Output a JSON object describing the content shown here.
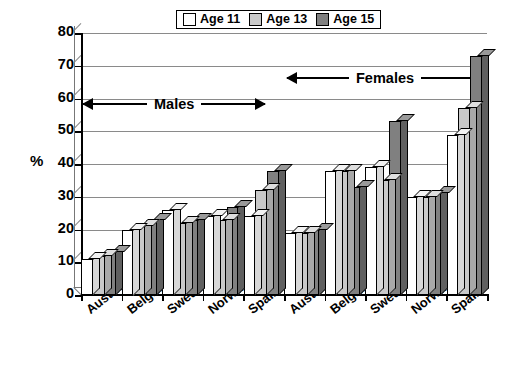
{
  "chart_data": {
    "type": "bar",
    "title": "",
    "subtitle": "",
    "xlabel": "",
    "ylabel": "%",
    "ylim": [
      0,
      80
    ],
    "ytick_step": 10,
    "yticks": [
      80,
      70,
      60,
      50,
      40,
      30,
      20,
      10,
      0
    ],
    "grid": true,
    "legend_position": "top-center",
    "style": "3d-clustered-columns",
    "categories": [
      "Austria",
      "Belgium",
      "Sweden",
      "Norway",
      "Spain",
      "Austria",
      "Belgium",
      "Sweden",
      "Norway",
      "Spain"
    ],
    "series": [
      {
        "name": "Age 11",
        "color": "#ffffff",
        "values": [
          11,
          20,
          26,
          24,
          24,
          19,
          38,
          39,
          30,
          49
        ]
      },
      {
        "name": "Age 13",
        "color": "#c9c9c9",
        "values": [
          12,
          21,
          22,
          23,
          32,
          19,
          38,
          35,
          30,
          57
        ]
      },
      {
        "name": "Age 15",
        "color": "#808080",
        "values": [
          13,
          23,
          23,
          27,
          38,
          20,
          33,
          53,
          31,
          73
        ]
      }
    ],
    "annotations": [
      {
        "label": "Males",
        "span_categories": [
          0,
          4
        ],
        "arrow": "double"
      },
      {
        "label": "Females",
        "span_categories": [
          5,
          9
        ],
        "arrow": "double"
      }
    ]
  },
  "legend": {
    "items": [
      {
        "label": "Age 11",
        "swatch": "white-square-icon"
      },
      {
        "label": "Age 13",
        "swatch": "light-gray-square-icon"
      },
      {
        "label": "Age 15",
        "swatch": "dark-gray-square-icon"
      }
    ]
  },
  "axis": {
    "y_label": "%",
    "y_ticks": [
      "80",
      "70",
      "60",
      "50",
      "40",
      "30",
      "20",
      "10",
      "0"
    ]
  },
  "annotations": {
    "males": "Males",
    "females": "Females"
  }
}
